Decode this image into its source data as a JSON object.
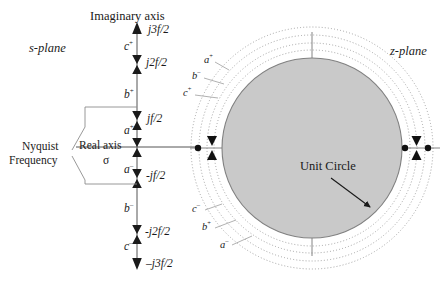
{
  "figure": {
    "title_left": "s-plane",
    "title_right": "z-plane",
    "imaginary_axis_label": "Imaginary axis",
    "real_axis_label": "Real axis",
    "sigma_symbol": "σ",
    "nyquist_line1": "Nyquist",
    "nyquist_line2": "Frequency",
    "unit_circle_label": "Unit Circle"
  },
  "colors": {
    "ink": "#1a1a1a",
    "axis": "#555555",
    "disk_fill": "#c9c9c9",
    "disk_stroke": "#808080",
    "dotted": "#9a9a9a",
    "leader": "#8d8d8d"
  },
  "s_plane": {
    "axis_ticks": [
      {
        "id": "j3f2",
        "text": "j3f/2",
        "sign": "",
        "marker": "down"
      },
      {
        "id": "j2f2",
        "text": "j2f/2",
        "sign": "",
        "marker": "both"
      },
      {
        "id": "jf2",
        "text": "jf/2",
        "sign": "",
        "marker": "both"
      },
      {
        "id": "zero",
        "text": "",
        "sign": "",
        "marker": "both"
      },
      {
        "id": "mjf2",
        "text": "-jf/2",
        "sign": "",
        "marker": "both"
      },
      {
        "id": "mj2f2",
        "text": "-j2f/2",
        "sign": "",
        "marker": "both"
      },
      {
        "id": "mj3f2",
        "text": "–j3f/2",
        "sign": "",
        "marker": "up"
      }
    ],
    "band_labels": [
      {
        "id": "c_plus",
        "base": "c",
        "sup": "+"
      },
      {
        "id": "b_plus",
        "base": "b",
        "sup": "+"
      },
      {
        "id": "a_plus",
        "base": "a",
        "sup": "+"
      },
      {
        "id": "a_minus",
        "base": "a",
        "sup": "–"
      },
      {
        "id": "b_minus",
        "base": "b",
        "sup": "–"
      },
      {
        "id": "c_minus",
        "base": "c",
        "sup": "–"
      }
    ]
  },
  "z_plane": {
    "ring_labels_upper": [
      {
        "id": "a_plus_z",
        "base": "a",
        "sup": "+"
      },
      {
        "id": "b_minus_z",
        "base": "b",
        "sup": "–"
      },
      {
        "id": "c_plus_z",
        "base": "c",
        "sup": "+"
      }
    ],
    "ring_labels_lower": [
      {
        "id": "c_minus_z",
        "base": "c",
        "sup": "–"
      },
      {
        "id": "b_plus_z",
        "base": "b",
        "sup": "+"
      },
      {
        "id": "a_minus_z",
        "base": "a",
        "sup": "–"
      }
    ]
  }
}
